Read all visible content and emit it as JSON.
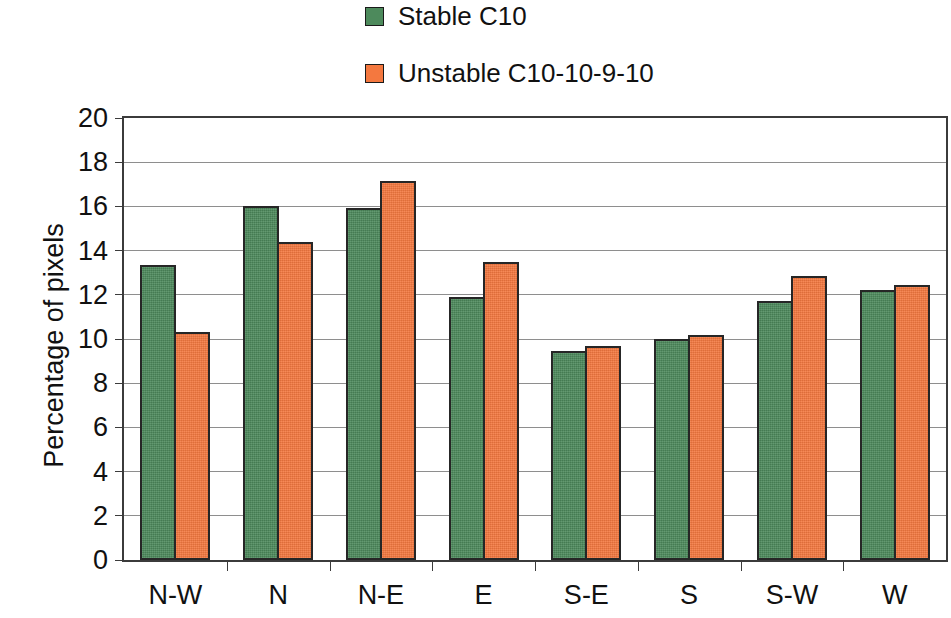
{
  "chart_data": {
    "type": "bar",
    "title": "",
    "xlabel": "",
    "ylabel": "Percentage of pixels",
    "ylim": [
      0,
      20
    ],
    "ytick_step": 2,
    "yticks": [
      20,
      18,
      16,
      14,
      12,
      10,
      8,
      6,
      4,
      2,
      0
    ],
    "grid": true,
    "legend_position": "top-center",
    "categories": [
      "N-W",
      "N",
      "N-E",
      "E",
      "S-E",
      "S",
      "S-W",
      "W"
    ],
    "series": [
      {
        "name": "Stable C10",
        "color": "#4d8a5c",
        "values": [
          13.35,
          16.0,
          15.95,
          11.9,
          9.45,
          10.0,
          11.7,
          12.2
        ]
      },
      {
        "name": "Unstable C10-10-9-10",
        "color": "#f4783f",
        "values": [
          10.3,
          14.4,
          17.15,
          13.5,
          9.7,
          10.2,
          12.85,
          12.45
        ]
      }
    ]
  }
}
